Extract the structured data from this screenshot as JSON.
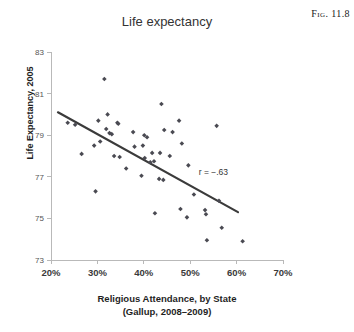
{
  "figure": {
    "caption": "Fig. 11.8"
  },
  "chart_data": {
    "type": "scatter",
    "title": "Life expectancy",
    "xlabel_line1": "Religious Attendance, by State",
    "xlabel_line2": "(Gallup, 2008–2009)",
    "ylabel": "Life Expectancy, 2005",
    "xlim": [
      20,
      70
    ],
    "ylim": [
      73,
      83
    ],
    "xticks": [
      20,
      30,
      40,
      50,
      60,
      70
    ],
    "xtick_labels": [
      "20%",
      "30%",
      "40%",
      "50%",
      "60%",
      "70%"
    ],
    "yticks": [
      73,
      75,
      77,
      79,
      81,
      83
    ],
    "ytick_labels": [
      "73",
      "75",
      "77",
      "79",
      "81",
      "83"
    ],
    "grid": false,
    "legend": "none",
    "annotations": [
      {
        "text": "r = −.63",
        "x": 55.0,
        "y": 77.1
      }
    ],
    "trendline": {
      "label": "linear fit",
      "x": [
        21.5,
        60.3
      ],
      "y": [
        80.1,
        75.3
      ]
    },
    "correlation": -0.63,
    "points": [
      {
        "x": 23.6,
        "y": 79.6
      },
      {
        "x": 25.2,
        "y": 79.5
      },
      {
        "x": 26.6,
        "y": 78.1
      },
      {
        "x": 29.3,
        "y": 78.5
      },
      {
        "x": 29.6,
        "y": 76.3
      },
      {
        "x": 30.2,
        "y": 79.7
      },
      {
        "x": 30.6,
        "y": 78.7
      },
      {
        "x": 31.5,
        "y": 81.7
      },
      {
        "x": 31.9,
        "y": 79.3
      },
      {
        "x": 32.2,
        "y": 80.0
      },
      {
        "x": 32.6,
        "y": 79.1
      },
      {
        "x": 33.1,
        "y": 79.05
      },
      {
        "x": 33.6,
        "y": 78.0
      },
      {
        "x": 34.3,
        "y": 79.6
      },
      {
        "x": 34.5,
        "y": 79.55
      },
      {
        "x": 34.8,
        "y": 77.95
      },
      {
        "x": 36.2,
        "y": 77.4
      },
      {
        "x": 37.7,
        "y": 79.15
      },
      {
        "x": 38.0,
        "y": 78.45
      },
      {
        "x": 39.5,
        "y": 77.05
      },
      {
        "x": 39.8,
        "y": 78.5
      },
      {
        "x": 40.1,
        "y": 79.0
      },
      {
        "x": 40.2,
        "y": 77.9
      },
      {
        "x": 40.7,
        "y": 78.9
      },
      {
        "x": 41.4,
        "y": 77.7
      },
      {
        "x": 41.8,
        "y": 78.15
      },
      {
        "x": 42.2,
        "y": 77.75
      },
      {
        "x": 42.4,
        "y": 75.25
      },
      {
        "x": 43.3,
        "y": 76.9
      },
      {
        "x": 43.5,
        "y": 78.15
      },
      {
        "x": 43.8,
        "y": 80.5
      },
      {
        "x": 44.2,
        "y": 76.85
      },
      {
        "x": 44.4,
        "y": 79.25
      },
      {
        "x": 45.6,
        "y": 78.0
      },
      {
        "x": 46.2,
        "y": 79.15
      },
      {
        "x": 47.6,
        "y": 79.7
      },
      {
        "x": 47.9,
        "y": 75.45
      },
      {
        "x": 48.2,
        "y": 78.6
      },
      {
        "x": 49.3,
        "y": 75.05
      },
      {
        "x": 49.6,
        "y": 77.55
      },
      {
        "x": 50.8,
        "y": 76.15
      },
      {
        "x": 53.2,
        "y": 75.4
      },
      {
        "x": 53.4,
        "y": 75.2
      },
      {
        "x": 53.6,
        "y": 73.95
      },
      {
        "x": 55.7,
        "y": 79.45
      },
      {
        "x": 56.2,
        "y": 75.85
      },
      {
        "x": 56.8,
        "y": 74.55
      },
      {
        "x": 61.3,
        "y": 73.9
      }
    ]
  }
}
